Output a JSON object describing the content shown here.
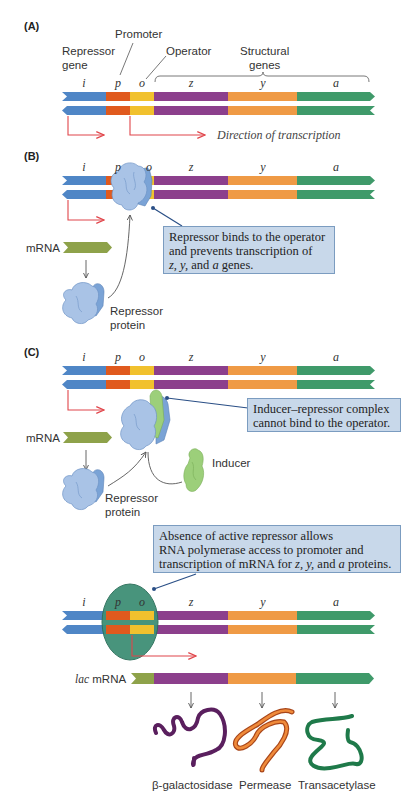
{
  "colors": {
    "i": "#4f86c6",
    "p": "#e05a1e",
    "o": "#f1c12e",
    "z": "#8c3f8c",
    "y": "#ef9a45",
    "a": "#3f9a6a",
    "mrna_leader": "#8ea24a",
    "transcription_arrow": "#e0454a",
    "callout_bg": "#c8d8ea",
    "repressor": "#a9c3e6",
    "inducer": "#9ccf7a",
    "polymerase": "#3f8f76"
  },
  "genes": [
    "i",
    "p",
    "o",
    "z",
    "y",
    "a"
  ],
  "panel_a": {
    "label": "(A)",
    "repressor_gene_label_1": "Repressor",
    "repressor_gene_label_2": "gene",
    "promoter_label": "Promoter",
    "operator_label": "Operator",
    "structural_label_1": "Structural",
    "structural_label_2": "genes",
    "direction_label": "Direction of transcription"
  },
  "panel_b": {
    "label": "(B)",
    "mrna_label": "mRNA",
    "repressor_label_1": "Repressor",
    "repressor_label_2": "protein",
    "callout_line1": "Repressor binds to the operator",
    "callout_line2": "and prevents transcription of",
    "callout_line3_z": "z, y,",
    "callout_line3_and": " and ",
    "callout_line3_a": "a",
    "callout_line3_rest": " genes."
  },
  "panel_c": {
    "label": "(C)",
    "mrna_label": "mRNA",
    "repressor_label_1": "Repressor",
    "repressor_label_2": "protein",
    "inducer_label": "Inducer",
    "callout_line1": "Inducer–repressor complex",
    "callout_line2": "cannot bind to the operator."
  },
  "panel_d": {
    "callout_line1": "Absence of active repressor allows",
    "callout_line2": "RNA polymerase access to promoter and",
    "callout_line3_pre": "transcription of mRNA for ",
    "callout_line3_zy": "z, y,",
    "callout_line3_and": " and ",
    "callout_line3_a": "a",
    "callout_line3_post": " proteins.",
    "lac_label_italic": "lac",
    "lac_label_rest": " mRNA",
    "proteins": [
      "β-galactosidase",
      "Permease",
      "Transacetylase"
    ]
  }
}
